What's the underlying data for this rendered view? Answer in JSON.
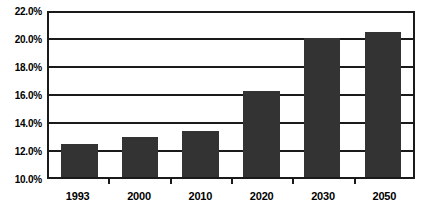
{
  "chart_data": {
    "type": "bar",
    "title": "",
    "xlabel": "",
    "ylabel": "",
    "categories": [
      "1993",
      "2000",
      "2010",
      "2020",
      "2030",
      "2050"
    ],
    "values": [
      12.5,
      13.0,
      13.4,
      16.3,
      20.1,
      20.5
    ],
    "value_labels": [
      "12.5%",
      "13.0%",
      "13.4%",
      "16.3%",
      "20.1%",
      "20.5%"
    ],
    "ylim": [
      10.0,
      22.0
    ],
    "ytick_values": [
      22.0,
      20.0,
      18.0,
      16.0,
      14.0,
      12.0,
      10.0
    ],
    "ytick_labels": [
      "22.0%",
      "20.0%",
      "18.0%",
      "16.0%",
      "14.0%",
      "12.0%",
      "10.0%"
    ],
    "grid": true,
    "grid_axis": "y",
    "legend": false,
    "legend_position": "none",
    "bar_color": "#333333",
    "axis_color": "#1a1a1a",
    "background_color": "#ffffff",
    "plot_background_color": "#ffffff"
  }
}
